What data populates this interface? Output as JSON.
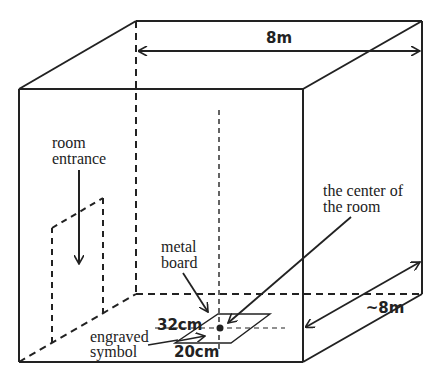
{
  "diagram": {
    "title": "",
    "labels": {
      "width_dimension": "8m",
      "depth_dimension": "~8m",
      "room_entrance_line1": "room",
      "room_entrance_line2": "entrance",
      "center_line1": "the center of",
      "center_line2": "the room",
      "metal_board_line1": "metal",
      "metal_board_line2": "board",
      "board_length": "32cm",
      "board_width": "20cm",
      "engraved_line1": "engraved",
      "engraved_line2": "symbol"
    },
    "colors": {
      "line": "#222222",
      "background": "#ffffff"
    }
  }
}
